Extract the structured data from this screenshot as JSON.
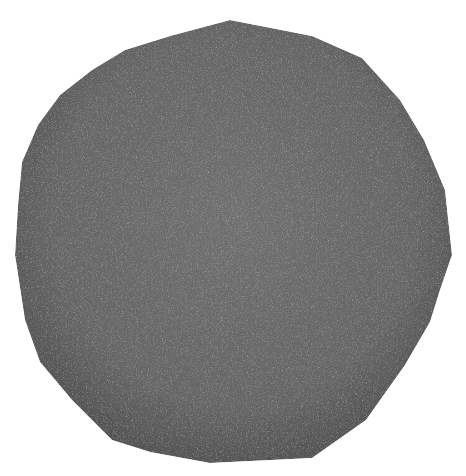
{
  "image": {
    "width": 466,
    "height": 476,
    "background_color": "#ffffff"
  },
  "shape": {
    "kind": "polygon",
    "fill_color": "#6b6b6b",
    "edge_shade_color": "#4a4a4a",
    "highlight_color": "#808080",
    "texture": "fine-grain-noise",
    "points": "230,20 312,36 362,58 400,100 424,140 445,190 452,255 440,290 430,322 405,365 366,420 312,458 210,463 150,452 112,440 72,400 40,362 25,320 15,255 18,205 22,162 38,125 60,95 92,70 125,50 170,36"
  }
}
